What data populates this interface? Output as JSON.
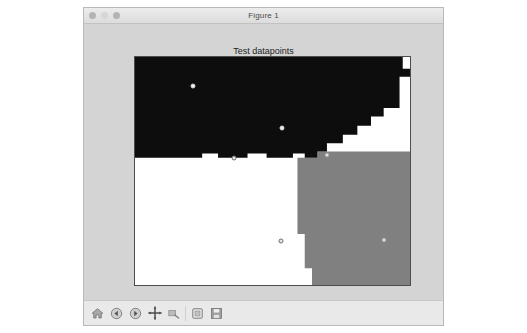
{
  "window": {
    "title": "Figure 1",
    "controls": [
      {
        "name": "close-button",
        "state": "active"
      },
      {
        "name": "minimize-button",
        "state": "dim"
      },
      {
        "name": "zoom-button",
        "state": "active"
      }
    ]
  },
  "toolbar": {
    "message": "",
    "buttons": [
      {
        "icon": "home-icon",
        "label": "Home"
      },
      {
        "icon": "back-arrow-icon",
        "label": "Back"
      },
      {
        "icon": "forward-arrow-icon",
        "label": "Forward"
      },
      {
        "icon": "pan-move-icon",
        "label": "Pan"
      },
      {
        "icon": "zoom-rect-icon",
        "label": "Zoom to rectangle"
      },
      {
        "icon": "subplots-configure-icon",
        "label": "Configure subplots"
      },
      {
        "icon": "save-disk-icon",
        "label": "Save the figure"
      }
    ]
  },
  "chart_data": {
    "type": "scatter",
    "title": "Test datapoints",
    "xlabel": "",
    "ylabel": "",
    "xlim": [
      1.72,
      7.78
    ],
    "ylim": [
      0.88,
      6.86
    ],
    "xticks": [
      2,
      3,
      4,
      5,
      6,
      7
    ],
    "yticks": [
      1,
      2,
      3,
      4,
      5,
      6
    ],
    "grid": false,
    "legend": null,
    "background_regions": [
      {
        "name": "class-dark",
        "color": "#0d0d0d",
        "description": "upper decision region"
      },
      {
        "name": "class-white",
        "color": "#ffffff",
        "description": "lower-left decision region"
      },
      {
        "name": "class-gray",
        "color": "#808080",
        "description": "lower-right decision region"
      }
    ],
    "points": [
      {
        "x": 3.0,
        "y": 6.1,
        "marker": "light",
        "region": "class-dark"
      },
      {
        "x": 4.95,
        "y": 5.0,
        "marker": "light",
        "region": "class-dark"
      },
      {
        "x": 3.9,
        "y": 4.2,
        "marker": "open",
        "region": "class-white"
      },
      {
        "x": 4.93,
        "y": 2.03,
        "marker": "open",
        "region": "class-white"
      },
      {
        "x": 5.95,
        "y": 4.3,
        "marker": "onGray",
        "region": "class-gray"
      },
      {
        "x": 7.2,
        "y": 2.05,
        "marker": "onGray",
        "region": "class-gray"
      }
    ]
  }
}
